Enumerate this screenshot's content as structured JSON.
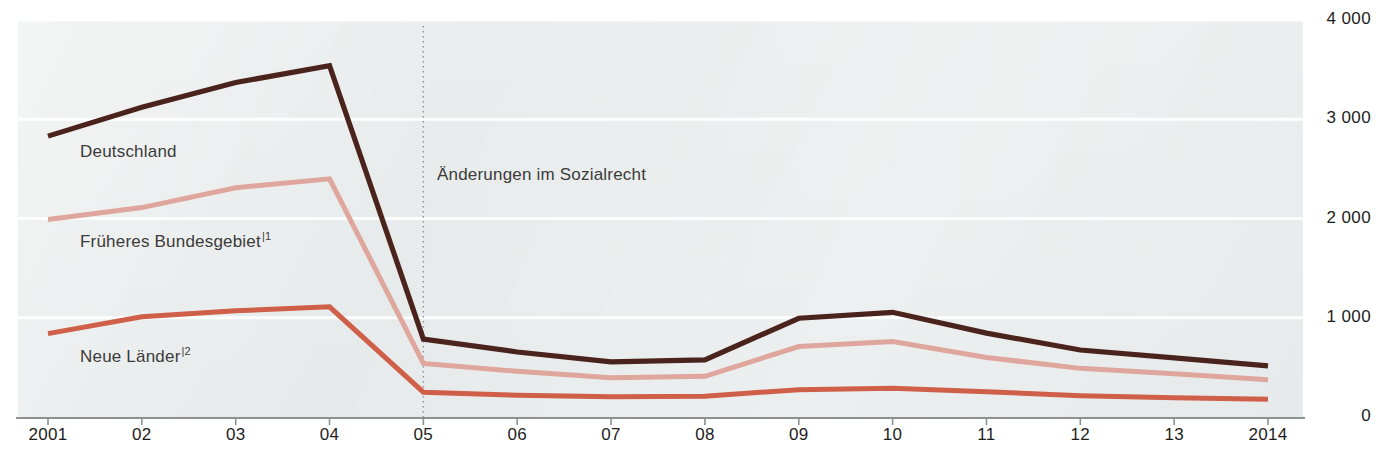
{
  "chart_data": {
    "type": "line",
    "title": "",
    "subtitle": "",
    "xlabel": "",
    "ylabel": "",
    "grid": true,
    "legend_position": "inline-labels",
    "x": [
      "2001",
      "02",
      "03",
      "04",
      "05",
      "06",
      "07",
      "08",
      "09",
      "10",
      "11",
      "12",
      "13",
      "2014"
    ],
    "xtick_labels": [
      "2001",
      "02",
      "03",
      "04",
      "05",
      "06",
      "07",
      "08",
      "09",
      "10",
      "11",
      "12",
      "13",
      "2014"
    ],
    "ytick_labels": [
      "4 000",
      "3 000",
      "2 000",
      "1 000",
      "0"
    ],
    "ytick_values": [
      4000,
      3000,
      2000,
      1000,
      0
    ],
    "ylim": [
      0,
      4000
    ],
    "series": [
      {
        "name": "Deutschland",
        "color": "#4a241c",
        "label_x": 80,
        "label_y": 142,
        "footnote": "",
        "values": [
          2830,
          3120,
          3370,
          3540,
          785,
          655,
          555,
          575,
          995,
          1055,
          845,
          675,
          595,
          515
        ]
      },
      {
        "name": "Früheres Bundesgebiet",
        "color": "#dfa69e",
        "label_x": 80,
        "label_y": 230,
        "footnote": "|1",
        "values": [
          1990,
          2110,
          2310,
          2400,
          540,
          460,
          395,
          410,
          710,
          760,
          600,
          490,
          435,
          375
        ]
      },
      {
        "name": "Neue Länder",
        "color": "#cf5f49",
        "label_x": 80,
        "label_y": 345,
        "footnote": "|2",
        "values": [
          840,
          1010,
          1070,
          1110,
          250,
          220,
          205,
          210,
          275,
          290,
          255,
          215,
          195,
          180
        ]
      }
    ],
    "annotations": [
      {
        "text": "Änderungen im Sozialrecht",
        "at_x": "05",
        "label_x": 437,
        "label_y": 165,
        "line_color": "#8c9192",
        "style": "dotted-vertical"
      }
    ],
    "axis_color": "#8c9192",
    "gridline_color": "#ffffff",
    "plot_background": "#e9ecec"
  }
}
